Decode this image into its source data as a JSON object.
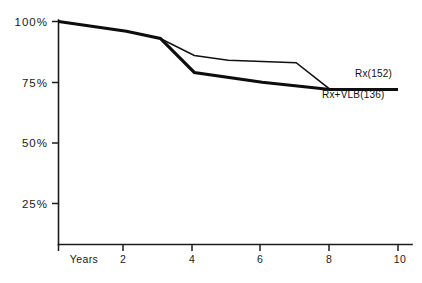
{
  "chart_data": {
    "type": "line",
    "title": "",
    "subtitle": "",
    "xlabel": "Years",
    "ylabel": "",
    "xlim": [
      0,
      10
    ],
    "ylim": [
      20,
      100
    ],
    "grid": false,
    "legend_position": "inline-right",
    "x_ticks": [
      {
        "value": 0,
        "label": "Years"
      },
      {
        "value": 2,
        "label": "2"
      },
      {
        "value": 4,
        "label": "4"
      },
      {
        "value": 6,
        "label": "6"
      },
      {
        "value": 8,
        "label": "8"
      },
      {
        "value": 10,
        "label": "10"
      }
    ],
    "y_ticks": [
      {
        "value": 100,
        "label": "100%"
      },
      {
        "value": 75,
        "label": "75%"
      },
      {
        "value": 50,
        "label": "50%"
      },
      {
        "value": 25,
        "label": "25%"
      }
    ],
    "series": [
      {
        "name": "Rx(152)",
        "label": "Rx(152)",
        "style": "thin",
        "x": [
          0,
          2,
          3,
          4,
          5,
          7,
          8,
          10
        ],
        "values": [
          100,
          96,
          93,
          86,
          84,
          83,
          72,
          72
        ]
      },
      {
        "name": "Rx+VLB(136)",
        "label": "Rx+VLB(136)",
        "style": "thick",
        "x": [
          0,
          2,
          3,
          4,
          6,
          8,
          10
        ],
        "values": [
          100,
          96,
          93,
          79,
          75,
          72,
          72
        ]
      }
    ],
    "annotations": [
      {
        "text": "Rx(152)",
        "x": 8.7,
        "y": 77.5
      },
      {
        "text": "Rx+VLB(136)",
        "x": 7.8,
        "y": 67.5
      }
    ]
  }
}
